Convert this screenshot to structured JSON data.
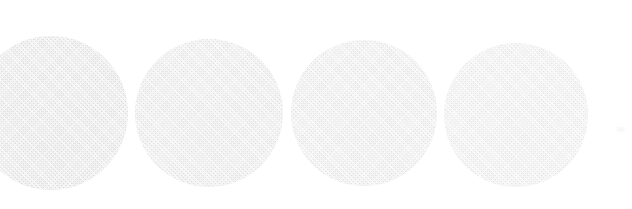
{
  "canvas": {
    "width": 632,
    "height": 209,
    "background_color": "#ffffff",
    "medium": "scanned-print-halftone",
    "description": "Row of four pale gray circles on a white page; leftmost circle is cropped by the left edge"
  },
  "shapes": [
    {
      "name": "circle-1",
      "label": "Circle 1 (cropped at left edge)",
      "center_x": 51,
      "center_y": 113,
      "diameter": 154,
      "left": -26,
      "top": 36,
      "right": 128,
      "bottom": 190,
      "fill_color": "#dedede",
      "edge_color": "#d4d4d4",
      "clipped": "left",
      "texture": "halftone-dither"
    },
    {
      "name": "circle-2",
      "label": "Circle 2",
      "center_x": 209,
      "center_y": 113,
      "diameter": 148,
      "left": 135,
      "top": 39,
      "right": 283,
      "bottom": 187,
      "fill_color": "#e2e2e2",
      "edge_color": "#dcdcdc",
      "clipped": "none",
      "texture": "halftone-dither"
    },
    {
      "name": "circle-3",
      "label": "Circle 3",
      "center_x": 364,
      "center_y": 113,
      "diameter": 146,
      "left": 291,
      "top": 40,
      "right": 437,
      "bottom": 186,
      "fill_color": "#e4e4e4",
      "edge_color": "#dedede",
      "clipped": "none",
      "texture": "halftone-dither"
    },
    {
      "name": "circle-4",
      "label": "Circle 4",
      "center_x": 516,
      "center_y": 115,
      "diameter": 144,
      "left": 444,
      "top": 43,
      "right": 588,
      "bottom": 187,
      "fill_color": "#e7e7e7",
      "edge_color": "#e1e1e1",
      "clipped": "none",
      "texture": "halftone-dither"
    }
  ],
  "artifacts": [
    {
      "name": "speck",
      "label": "Faint scan speck",
      "center_x": 620,
      "center_y": 131,
      "size": 9,
      "color": "#f2f2f2"
    },
    {
      "name": "left-edge-shadow",
      "label": "Darker scan band along left edge",
      "left": 0,
      "top": 60,
      "width": 14,
      "height": 104,
      "color": "#d6d6d6"
    }
  ],
  "colors": {
    "page": "#ffffff",
    "circle_light": "#e7e7e7",
    "circle_mid": "#e2e2e2",
    "circle_dark": "#dedede",
    "shadow": "#d6d6d6",
    "speck": "#f2f2f2"
  }
}
